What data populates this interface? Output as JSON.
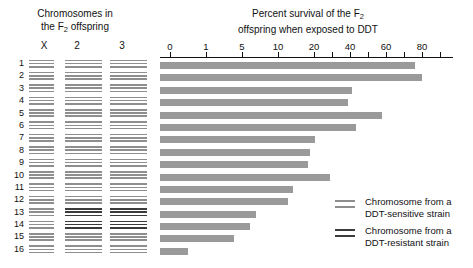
{
  "chrom_panel": {
    "title_line1": "Chromosomes in",
    "title_line2_pre": "the F",
    "title_line2_sub": "2",
    "title_line2_post": " offspring",
    "columns": [
      "X",
      "2",
      "3"
    ],
    "row_numbers": [
      "1",
      "2",
      "3",
      "4",
      "5",
      "6",
      "7",
      "8",
      "9",
      "10",
      "11",
      "12",
      "13",
      "14",
      "15",
      "16"
    ]
  },
  "chart": {
    "title_line1_pre": "Percent survival of the F",
    "title_line1_sub": "2",
    "title_line2": "offspring when exposed to DDT"
  },
  "legend": {
    "items": [
      {
        "label_line1": "Chromosome from a",
        "label_line2": "DDT-sensitive strain",
        "color": "#8e8e8e",
        "key": "sensitive"
      },
      {
        "label_line1": "Chromosome from a",
        "label_line2": "DDT-resistant strain",
        "color": "#3b3b3b",
        "key": "resistant"
      }
    ]
  },
  "colors": {
    "sensitive": "#8e8e8e",
    "resistant": "#3b3b3b",
    "bar": "#9a9a9a",
    "axis": "#111111"
  },
  "chart_data": {
    "type": "bar",
    "orientation": "horizontal",
    "title": "Percent survival of the F2 offspring when exposed to DDT",
    "xlabel": "Percent survival of the F2 offspring when exposed to DDT",
    "ylabel": "Chromosomes in the F2 offspring",
    "grid": false,
    "axis_scale": "nonlinear",
    "xticks": [
      0,
      1,
      5,
      10,
      20,
      40,
      60,
      80
    ],
    "xtick_labels": [
      "0",
      "1",
      "5",
      "10",
      "20",
      "40",
      "60",
      "80"
    ],
    "xtick_positions_px": [
      10,
      46,
      82,
      118,
      154,
      190,
      226,
      262,
      293
    ],
    "minor_ticks": [
      30,
      50,
      70
    ],
    "xlim": [
      0,
      80
    ],
    "legend_position": "bottom-right",
    "categories": [
      "1",
      "2",
      "3",
      "4",
      "5",
      "6",
      "7",
      "8",
      "9",
      "10",
      "11",
      "12",
      "13",
      "14",
      "15",
      "16"
    ],
    "values": [
      68,
      70,
      45,
      43,
      56,
      47,
      30,
      28,
      27,
      35,
      22,
      21,
      13,
      12,
      9,
      2
    ],
    "bar_lengths_px": [
      255,
      262,
      192,
      188,
      222,
      196,
      155,
      150,
      148,
      170,
      133,
      128,
      96,
      90,
      74,
      28
    ],
    "series": [
      {
        "name": "Percent survival",
        "values": [
          68,
          70,
          45,
          43,
          56,
          47,
          30,
          28,
          27,
          35,
          22,
          21,
          13,
          12,
          9,
          2
        ]
      }
    ],
    "chromosome_genotypes": [
      {
        "row": "1",
        "X": "sensitive",
        "2": "sensitive",
        "3": "sensitive"
      },
      {
        "row": "2",
        "X": "sensitive",
        "2": "sensitive",
        "3": "sensitive"
      },
      {
        "row": "3",
        "X": "sensitive",
        "2": "sensitive",
        "3": "sensitive"
      },
      {
        "row": "4",
        "X": "sensitive",
        "2": "sensitive",
        "3": "sensitive"
      },
      {
        "row": "5",
        "X": "sensitive",
        "2": "sensitive",
        "3": "sensitive"
      },
      {
        "row": "6",
        "X": "sensitive",
        "2": "sensitive",
        "3": "sensitive"
      },
      {
        "row": "7",
        "X": "sensitive",
        "2": "sensitive",
        "3": "sensitive"
      },
      {
        "row": "8",
        "X": "sensitive",
        "2": "sensitive",
        "3": "sensitive"
      },
      {
        "row": "9",
        "X": "sensitive",
        "2": "sensitive",
        "3": "sensitive"
      },
      {
        "row": "10",
        "X": "sensitive",
        "2": "sensitive",
        "3": "sensitive"
      },
      {
        "row": "11",
        "X": "sensitive",
        "2": "sensitive",
        "3": "sensitive"
      },
      {
        "row": "12",
        "X": "sensitive",
        "2": "sensitive",
        "3": "sensitive"
      },
      {
        "row": "13",
        "X": "sensitive",
        "2": "resistant",
        "3": "resistant"
      },
      {
        "row": "14",
        "X": "sensitive",
        "2": "resistant",
        "3": "resistant"
      },
      {
        "row": "15",
        "X": "sensitive",
        "2": "sensitive",
        "3": "sensitive"
      },
      {
        "row": "16",
        "X": "sensitive",
        "2": "sensitive",
        "3": "sensitive"
      }
    ]
  }
}
